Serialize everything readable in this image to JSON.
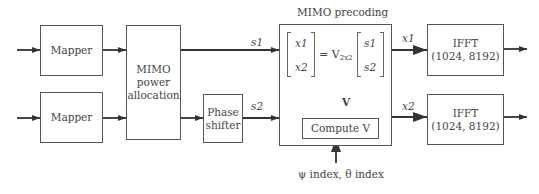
{
  "blocks": {
    "mapper1": "Mapper",
    "mapper2": "Mapper",
    "power_allocation": [
      "MIMO",
      "power",
      "allocation"
    ],
    "phase_shifter": [
      "Phase",
      "shifter"
    ],
    "precoding_title": "MIMO precoding",
    "compute_v": "Compute V",
    "ifft1": [
      "IFFT",
      "(1024, 8192)"
    ],
    "ifft2": [
      "IFFT",
      "(1024, 8192)"
    ]
  },
  "signals": {
    "s1": "s1",
    "s2": "s2",
    "x1": "x1",
    "x2": "x2",
    "v": "V"
  },
  "equation": {
    "lhs": [
      "x1",
      "x2"
    ],
    "operator": "= V",
    "subscript": "2x2",
    "rhs": [
      "s1",
      "s2"
    ]
  },
  "inputs": {
    "indices": "ψ index, θ index"
  },
  "colors": {
    "line": "#333333",
    "box_border": "#555555",
    "text": "#444444"
  }
}
